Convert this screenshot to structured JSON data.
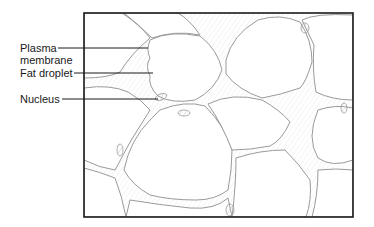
{
  "figure": {
    "labels": [
      {
        "id": "plasma-membrane",
        "line1": "Plasma",
        "line2": "membrane"
      },
      {
        "id": "fat-droplet",
        "text": "Fat droplet"
      },
      {
        "id": "nucleus",
        "text": "Nucleus"
      }
    ]
  },
  "colors": {
    "frame": "#1a1a1a",
    "cell_outline": "#9a9a9a",
    "hatch": "#b5b5b5",
    "leader": "#1a1a1a"
  }
}
